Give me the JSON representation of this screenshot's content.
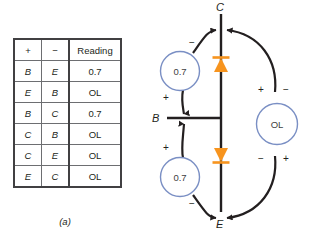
{
  "figure": {
    "panel_a": {
      "caption": "(a)",
      "table": {
        "headers": [
          "+",
          "−",
          "Reading"
        ],
        "rows": [
          {
            "plus": "B",
            "minus": "E",
            "reading": "0.7"
          },
          {
            "plus": "E",
            "minus": "B",
            "reading": "OL"
          },
          {
            "plus": "B",
            "minus": "C",
            "reading": "0.7"
          },
          {
            "plus": "C",
            "minus": "B",
            "reading": "OL"
          },
          {
            "plus": "C",
            "minus": "E",
            "reading": "OL"
          },
          {
            "plus": "E",
            "minus": "C",
            "reading": "OL"
          }
        ]
      }
    },
    "panel_b": {
      "caption": "(b)",
      "terminals": {
        "collector": "C",
        "base": "B",
        "emitter": "E"
      },
      "meters": [
        {
          "id": "meter-upper-left",
          "value": "0.7",
          "polarity_top": "−",
          "polarity_bottom": "+"
        },
        {
          "id": "meter-lower-left",
          "value": "0.7",
          "polarity_top": "+",
          "polarity_bottom": "−"
        },
        {
          "id": "meter-right",
          "value": "OL",
          "polarity_top_left": "+",
          "polarity_top_right": "−",
          "polarity_bottom_left": "−",
          "polarity_bottom_right": "+"
        }
      ],
      "diodes": [
        {
          "id": "diode-upper",
          "direction": "up"
        },
        {
          "id": "diode-lower",
          "direction": "down"
        }
      ]
    }
  },
  "colors": {
    "wire": "#231f20",
    "meter_outline": "#7a8fc4",
    "diode": "#f7941e",
    "table_border": "#414042",
    "text": "#231f20"
  }
}
